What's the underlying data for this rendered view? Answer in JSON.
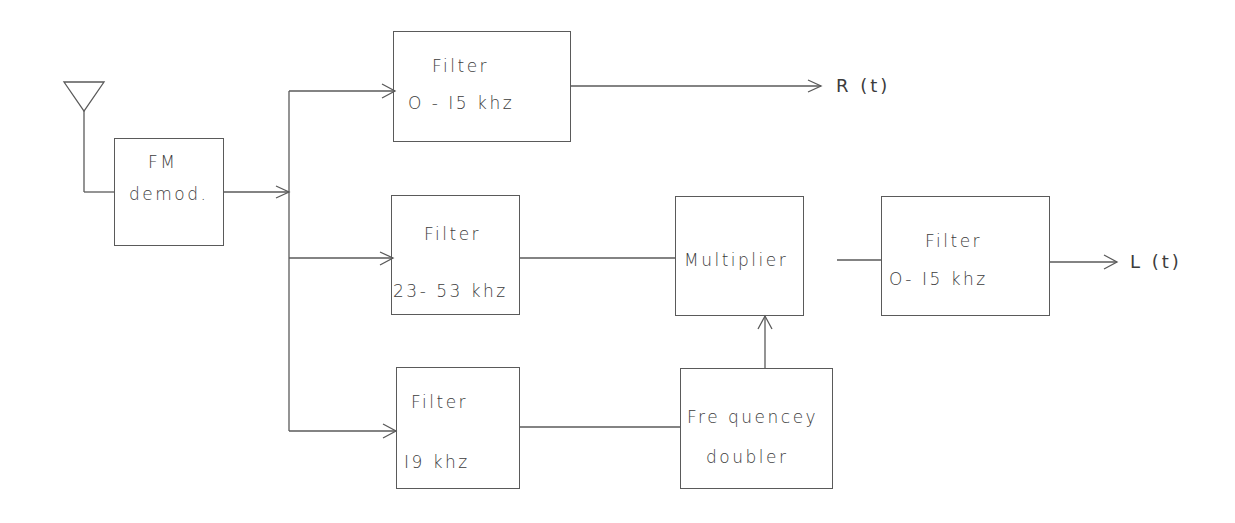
{
  "diagram": {
    "antenna": {
      "icon": "antenna-icon"
    },
    "blocks": {
      "fm_demod": {
        "line1": "FM",
        "line2": "demod."
      },
      "filter_r": {
        "line1": "Filter",
        "line2": "O - I5 khz"
      },
      "filter_sub": {
        "line1": "Filter",
        "line2": "23- 53 khz"
      },
      "multiplier": {
        "line1": "Multiplier"
      },
      "filter_l": {
        "line1": "Filter",
        "line2": "O- I5 khz"
      },
      "filter_pilot": {
        "line1": "Filter",
        "line2": "I9 khz"
      },
      "doubler": {
        "line1": "Fre quencey",
        "line2": "doubler"
      }
    },
    "outputs": {
      "right": "R (t)",
      "left": "L (t)"
    },
    "connections": [
      "antenna -> FM demod.",
      "FM demod. -> Filter 0-15 khz",
      "FM demod. -> Filter 23-53 khz",
      "FM demod. -> Filter 19 khz",
      "Filter 0-15 khz -> R(t)",
      "Filter 23-53 khz -> Multiplier",
      "Filter 19 khz -> Frequencey doubler",
      "Frequencey doubler -> Multiplier",
      "Multiplier -> Filter 0-15 khz",
      "Filter 0-15 khz -> L(t)"
    ],
    "line_color": "#5a5a5a"
  }
}
